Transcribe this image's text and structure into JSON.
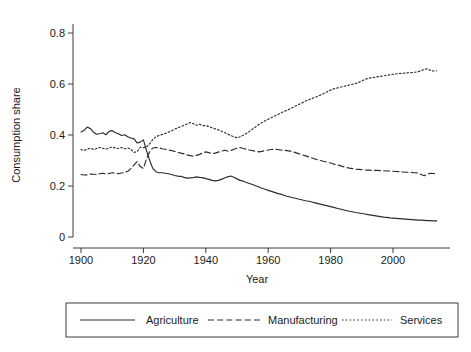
{
  "chart_data": {
    "type": "line",
    "title": "",
    "xlabel": "Year",
    "ylabel": "Consumption share",
    "xlim": [
      1900,
      2015
    ],
    "ylim": [
      0,
      0.88
    ],
    "grid": false,
    "legend_position": "bottom",
    "xticks": [
      1900,
      1920,
      1940,
      1960,
      1980,
      2000
    ],
    "xtick_labels": [
      "1900",
      "1920",
      "1940",
      "1960",
      "1980",
      "2000"
    ],
    "yticks": [
      0,
      0.2,
      0.4,
      0.6,
      0.8
    ],
    "ytick_labels": [
      "0",
      "0.2",
      "0.4",
      "0.6",
      "0.8"
    ],
    "x": [
      1900,
      1901,
      1902,
      1903,
      1904,
      1905,
      1906,
      1907,
      1908,
      1909,
      1910,
      1911,
      1912,
      1913,
      1914,
      1915,
      1916,
      1917,
      1918,
      1919,
      1920,
      1921,
      1922,
      1923,
      1924,
      1925,
      1926,
      1927,
      1928,
      1929,
      1930,
      1931,
      1932,
      1933,
      1934,
      1935,
      1936,
      1937,
      1938,
      1939,
      1940,
      1941,
      1942,
      1943,
      1944,
      1945,
      1946,
      1947,
      1948,
      1949,
      1950,
      1951,
      1952,
      1953,
      1954,
      1955,
      1956,
      1957,
      1958,
      1959,
      1960,
      1961,
      1962,
      1963,
      1964,
      1965,
      1966,
      1967,
      1968,
      1969,
      1970,
      1971,
      1972,
      1973,
      1974,
      1975,
      1976,
      1977,
      1978,
      1979,
      1980,
      1981,
      1982,
      1983,
      1984,
      1985,
      1986,
      1987,
      1988,
      1989,
      1990,
      1991,
      1992,
      1993,
      1994,
      1995,
      1996,
      1997,
      1998,
      1999,
      2000,
      2001,
      2002,
      2003,
      2004,
      2005,
      2006,
      2007,
      2008,
      2009,
      2010,
      2011,
      2012,
      2013,
      2014
    ],
    "series": [
      {
        "name": "Agriculture",
        "style": "solid",
        "values": [
          0.412,
          0.418,
          0.431,
          0.425,
          0.411,
          0.403,
          0.405,
          0.409,
          0.401,
          0.414,
          0.417,
          0.409,
          0.405,
          0.398,
          0.401,
          0.393,
          0.388,
          0.385,
          0.369,
          0.372,
          0.381,
          0.339,
          0.301,
          0.269,
          0.256,
          0.252,
          0.252,
          0.25,
          0.248,
          0.245,
          0.241,
          0.239,
          0.238,
          0.234,
          0.231,
          0.232,
          0.233,
          0.236,
          0.234,
          0.233,
          0.229,
          0.226,
          0.222,
          0.22,
          0.222,
          0.226,
          0.231,
          0.236,
          0.239,
          0.234,
          0.228,
          0.222,
          0.219,
          0.214,
          0.21,
          0.206,
          0.201,
          0.196,
          0.191,
          0.187,
          0.183,
          0.179,
          0.175,
          0.171,
          0.168,
          0.164,
          0.16,
          0.157,
          0.154,
          0.151,
          0.148,
          0.145,
          0.142,
          0.14,
          0.137,
          0.134,
          0.131,
          0.128,
          0.125,
          0.122,
          0.119,
          0.116,
          0.113,
          0.11,
          0.107,
          0.104,
          0.101,
          0.099,
          0.096,
          0.094,
          0.092,
          0.09,
          0.088,
          0.086,
          0.084,
          0.082,
          0.08,
          0.078,
          0.077,
          0.075,
          0.074,
          0.073,
          0.072,
          0.071,
          0.07,
          0.069,
          0.068,
          0.067,
          0.066,
          0.066,
          0.065,
          0.064,
          0.064,
          0.063,
          0.063
        ]
      },
      {
        "name": "Manufacturing",
        "style": "dashed",
        "values": [
          0.245,
          0.243,
          0.244,
          0.247,
          0.246,
          0.245,
          0.248,
          0.25,
          0.247,
          0.249,
          0.252,
          0.25,
          0.248,
          0.251,
          0.253,
          0.258,
          0.268,
          0.283,
          0.296,
          0.276,
          0.269,
          0.307,
          0.334,
          0.349,
          0.351,
          0.35,
          0.346,
          0.344,
          0.341,
          0.339,
          0.336,
          0.332,
          0.329,
          0.326,
          0.322,
          0.319,
          0.317,
          0.32,
          0.324,
          0.33,
          0.334,
          0.331,
          0.327,
          0.329,
          0.333,
          0.336,
          0.34,
          0.337,
          0.339,
          0.344,
          0.348,
          0.351,
          0.347,
          0.344,
          0.341,
          0.339,
          0.336,
          0.334,
          0.336,
          0.339,
          0.341,
          0.343,
          0.344,
          0.343,
          0.341,
          0.34,
          0.339,
          0.337,
          0.334,
          0.33,
          0.326,
          0.322,
          0.318,
          0.314,
          0.31,
          0.306,
          0.302,
          0.299,
          0.296,
          0.293,
          0.29,
          0.286,
          0.283,
          0.28,
          0.276,
          0.273,
          0.27,
          0.268,
          0.266,
          0.265,
          0.264,
          0.263,
          0.262,
          0.262,
          0.261,
          0.261,
          0.26,
          0.26,
          0.259,
          0.259,
          0.258,
          0.257,
          0.256,
          0.255,
          0.254,
          0.254,
          0.253,
          0.252,
          0.251,
          0.245,
          0.24,
          0.246,
          0.25,
          0.249,
          0.248
        ]
      },
      {
        "name": "Services",
        "style": "dotted",
        "values": [
          0.343,
          0.339,
          0.345,
          0.348,
          0.343,
          0.347,
          0.351,
          0.348,
          0.345,
          0.349,
          0.353,
          0.349,
          0.347,
          0.351,
          0.346,
          0.349,
          0.344,
          0.332,
          0.335,
          0.352,
          0.35,
          0.354,
          0.365,
          0.382,
          0.393,
          0.398,
          0.402,
          0.406,
          0.411,
          0.416,
          0.423,
          0.428,
          0.433,
          0.438,
          0.443,
          0.449,
          0.444,
          0.438,
          0.442,
          0.437,
          0.437,
          0.433,
          0.428,
          0.424,
          0.42,
          0.415,
          0.409,
          0.404,
          0.398,
          0.393,
          0.389,
          0.393,
          0.399,
          0.406,
          0.414,
          0.423,
          0.432,
          0.441,
          0.449,
          0.456,
          0.462,
          0.468,
          0.474,
          0.48,
          0.486,
          0.492,
          0.497,
          0.503,
          0.509,
          0.515,
          0.521,
          0.527,
          0.533,
          0.538,
          0.543,
          0.548,
          0.553,
          0.558,
          0.564,
          0.57,
          0.576,
          0.581,
          0.584,
          0.587,
          0.59,
          0.593,
          0.596,
          0.599,
          0.602,
          0.606,
          0.612,
          0.618,
          0.622,
          0.624,
          0.626,
          0.628,
          0.63,
          0.632,
          0.634,
          0.636,
          0.638,
          0.64,
          0.641,
          0.642,
          0.643,
          0.644,
          0.645,
          0.646,
          0.648,
          0.652,
          0.657,
          0.66,
          0.653,
          0.651,
          0.652
        ]
      }
    ]
  },
  "legend": {
    "entries": [
      {
        "label": "Agriculture",
        "style": "solid"
      },
      {
        "label": "Manufacturing",
        "style": "dashed"
      },
      {
        "label": "Services",
        "style": "dotted"
      }
    ]
  }
}
